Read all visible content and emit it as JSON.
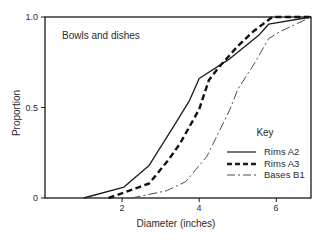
{
  "chart_data": {
    "type": "line",
    "title": "",
    "annotation": "Bowls and dishes",
    "xlabel": "Diameter (inches)",
    "ylabel": "Proportion",
    "xlim": [
      0,
      6.9
    ],
    "ylim": [
      0,
      1.0
    ],
    "x_ticks": [
      2,
      4,
      6
    ],
    "x_tick_labels": [
      "2",
      "4",
      "6"
    ],
    "y_ticks": [
      0,
      0.5,
      1.0
    ],
    "y_tick_labels": [
      "0",
      "0.5",
      "1.0"
    ],
    "grid": false,
    "axis_color": "#1a1a1a",
    "legend": {
      "title": "Key",
      "position": "inside lower right"
    },
    "series": [
      {
        "name": "Rims A2",
        "line_style": "solid",
        "color": "#1a1a1a",
        "width": 1.3,
        "points": [
          [
            1.0,
            0
          ],
          [
            2.05,
            0.06
          ],
          [
            2.7,
            0.18
          ],
          [
            3.35,
            0.4
          ],
          [
            3.75,
            0.54
          ],
          [
            4.0,
            0.66
          ],
          [
            4.8,
            0.77
          ],
          [
            5.55,
            0.9
          ],
          [
            5.8,
            0.96
          ],
          [
            6.9,
            1.0
          ]
        ]
      },
      {
        "name": "Rims A3",
        "line_style": "dashed",
        "color": "#111111",
        "width": 2.4,
        "points": [
          [
            1.65,
            0
          ],
          [
            2.45,
            0.06
          ],
          [
            2.7,
            0.08
          ],
          [
            3.2,
            0.21
          ],
          [
            3.5,
            0.3
          ],
          [
            4.0,
            0.49
          ],
          [
            4.25,
            0.65
          ],
          [
            4.5,
            0.72
          ],
          [
            5.0,
            0.84
          ],
          [
            5.4,
            0.92
          ],
          [
            5.9,
            1.0
          ],
          [
            6.9,
            1.0
          ]
        ]
      },
      {
        "name": "Bases B1",
        "line_style": "dashdot",
        "color": "#4d4d4d",
        "width": 1.0,
        "points": [
          [
            2.25,
            0
          ],
          [
            3.15,
            0.04
          ],
          [
            3.65,
            0.09
          ],
          [
            4.2,
            0.23
          ],
          [
            4.5,
            0.36
          ],
          [
            4.8,
            0.49
          ],
          [
            5.0,
            0.6
          ],
          [
            5.45,
            0.75
          ],
          [
            5.8,
            0.88
          ],
          [
            6.1,
            0.92
          ],
          [
            6.9,
            1.0
          ]
        ]
      }
    ]
  }
}
